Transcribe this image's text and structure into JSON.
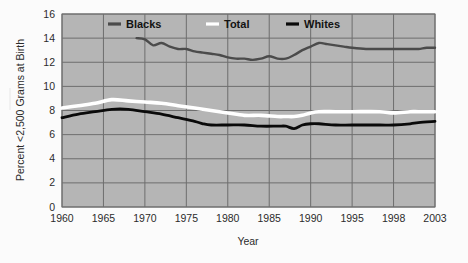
{
  "chart_data": {
    "type": "line",
    "title": "",
    "xlabel": "Year",
    "ylabel": "Percent <2,500 Grams at Birth",
    "xlim": [
      1960,
      2003
    ],
    "ylim": [
      0,
      16
    ],
    "ytick_labels": [
      "0",
      "2",
      "4",
      "6",
      "8",
      "10",
      "12",
      "14",
      "16"
    ],
    "ytick_values": [
      0,
      2,
      4,
      6,
      8,
      10,
      12,
      14,
      16
    ],
    "xtick_labels": [
      "1960",
      "1965",
      "1970",
      "1975",
      "1980",
      "1985",
      "1990",
      "1995",
      "1998",
      "2003"
    ],
    "xtick_values": [
      1960,
      1965,
      1970,
      1975,
      1980,
      1985,
      1990,
      1995,
      1998,
      2003
    ],
    "grid": true,
    "legend_position": "top-center",
    "plot_background": "#b5b5b5",
    "series": [
      {
        "name": "Blacks",
        "color": "#4b4b4b",
        "linewidth": 2.4,
        "x": [
          1969,
          1970,
          1971,
          1972,
          1973,
          1974,
          1975,
          1976,
          1977,
          1978,
          1979,
          1980,
          1981,
          1982,
          1983,
          1984,
          1985,
          1986,
          1987,
          1988,
          1989,
          1990,
          1991,
          1992,
          1993,
          1994,
          1995,
          1996,
          1997,
          1998,
          1999,
          2000,
          2001,
          2002,
          2003
        ],
        "values": [
          14.0,
          13.9,
          13.4,
          13.6,
          13.3,
          13.1,
          13.1,
          12.9,
          12.8,
          12.7,
          12.6,
          12.4,
          12.3,
          12.3,
          12.2,
          12.3,
          12.5,
          12.3,
          12.3,
          12.6,
          13.0,
          13.3,
          13.6,
          13.5,
          13.4,
          13.3,
          13.2,
          13.1,
          13.1,
          13.1,
          13.1,
          13.1,
          13.1,
          13.2,
          13.2
        ]
      },
      {
        "name": "Total",
        "color": "#ffffff",
        "linewidth": 3.6,
        "x": [
          1960,
          1962,
          1964,
          1966,
          1968,
          1970,
          1972,
          1974,
          1976,
          1978,
          1980,
          1982,
          1984,
          1986,
          1987,
          1988,
          1989,
          1990,
          1991,
          1993,
          1995,
          1997,
          1998,
          2000,
          2001,
          2003
        ],
        "values": [
          8.2,
          8.4,
          8.6,
          8.9,
          8.8,
          8.7,
          8.6,
          8.4,
          8.2,
          8.0,
          7.8,
          7.6,
          7.6,
          7.5,
          7.5,
          7.5,
          7.6,
          7.8,
          7.9,
          7.9,
          7.9,
          7.9,
          7.8,
          7.9,
          7.9,
          7.9
        ]
      },
      {
        "name": "Whites",
        "color": "#0a0a0a",
        "linewidth": 2.8,
        "x": [
          1960,
          1962,
          1964,
          1966,
          1968,
          1970,
          1972,
          1974,
          1976,
          1977,
          1978,
          1980,
          1982,
          1984,
          1986,
          1987,
          1988,
          1989,
          1990,
          1991,
          1993,
          1995,
          1997,
          1998,
          2000,
          2001,
          2003
        ],
        "values": [
          7.4,
          7.7,
          7.9,
          8.1,
          8.1,
          7.9,
          7.7,
          7.4,
          7.1,
          6.9,
          6.8,
          6.8,
          6.8,
          6.7,
          6.7,
          6.7,
          6.5,
          6.8,
          6.9,
          6.9,
          6.8,
          6.8,
          6.8,
          6.8,
          6.9,
          7.0,
          7.1
        ]
      }
    ],
    "legend": [
      {
        "label": "Blacks",
        "color": "#4b4b4b"
      },
      {
        "label": "Total",
        "color": "#ffffff"
      },
      {
        "label": "Whites",
        "color": "#0a0a0a"
      }
    ]
  }
}
